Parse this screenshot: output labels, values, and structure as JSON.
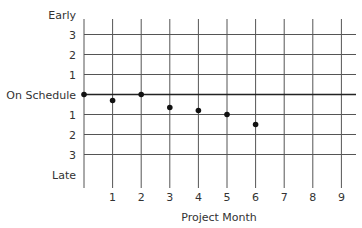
{
  "chart_data": {
    "type": "scatter",
    "title": "",
    "xlabel": "Project Month",
    "ylabel": "",
    "x": [
      0,
      1,
      2,
      3,
      4,
      5,
      6
    ],
    "series": [
      {
        "name": "Schedule variance",
        "values": [
          0,
          -0.3,
          0,
          -0.65,
          -0.8,
          -1.0,
          -1.5
        ]
      }
    ],
    "x_ticks": [
      "1",
      "2",
      "3",
      "4",
      "5",
      "6",
      "7",
      "8",
      "9"
    ],
    "y_ticks": [
      {
        "value": 4,
        "label": "Early"
      },
      {
        "value": 3,
        "label": "3"
      },
      {
        "value": 2,
        "label": "2"
      },
      {
        "value": 1,
        "label": "1"
      },
      {
        "value": 0,
        "label": "On Schedule"
      },
      {
        "value": -1,
        "label": "1"
      },
      {
        "value": -2,
        "label": "2"
      },
      {
        "value": -3,
        "label": "3"
      },
      {
        "value": -4,
        "label": "Late"
      }
    ],
    "xlim": [
      0,
      9
    ],
    "ylim": [
      -4,
      4
    ],
    "grid": true,
    "legend": "none",
    "colors": {
      "grid": "#555555",
      "baseline": "#222222",
      "points": "#111111",
      "text": "#333333"
    }
  }
}
